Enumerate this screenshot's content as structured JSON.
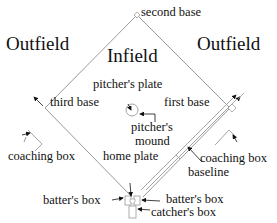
{
  "regions": {
    "outfield_left": "Outfield",
    "outfield_right": "Outfield",
    "infield": "Infield"
  },
  "labels": {
    "second_base": "second base",
    "third_base": "third base",
    "first_base": "first base",
    "pitchers_plate": "pitcher's plate",
    "pitchers_mound_1": "pitcher's",
    "pitchers_mound_2": "mound",
    "home_plate": "home plate",
    "coaching_box_left": "coaching box",
    "coaching_box_right": "coaching box",
    "baseline": "baseline",
    "batters_box_left": "batter's box",
    "batters_box_right": "batter's box",
    "catchers_box": "catcher's box"
  },
  "colors": {
    "line": "#9a9a9a",
    "arrow": "#111111",
    "text": "#111111"
  }
}
